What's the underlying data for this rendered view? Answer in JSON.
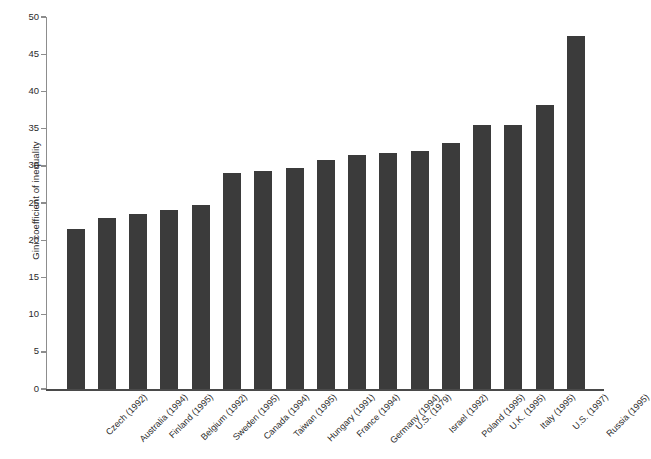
{
  "chart_data": {
    "type": "bar",
    "title": "",
    "xlabel": "",
    "ylabel": "Gini coefficient of inequality",
    "ylim": [
      0,
      50
    ],
    "ytick_step": 5,
    "yticks": [
      50,
      45,
      40,
      35,
      30,
      25,
      20,
      15,
      10,
      5,
      0
    ],
    "grid": false,
    "legend": null,
    "bar_color": "#3b3b3b",
    "axis_color": "#4a4a4a",
    "categories": [
      "Czech (1992)",
      "Australia (1994)",
      "Finland (1995)",
      "Belgium (1992)",
      "Sweden (1995)",
      "Canada (1994)",
      "Taiwan (1995)",
      "Hungary (1991)",
      "France (1994)",
      "Germany (1994)",
      "U.S. (1979)",
      "Israel (1992)",
      "Poland (1995)",
      "U.K. (1995)",
      "Italy (1995)",
      "U.S. (1997)",
      "Russia (1995)"
    ],
    "values": [
      21.5,
      23.0,
      23.5,
      24.0,
      24.8,
      29.1,
      29.3,
      29.7,
      30.8,
      31.4,
      31.7,
      32.0,
      33.1,
      35.5,
      35.5,
      38.2,
      47.4
    ]
  }
}
